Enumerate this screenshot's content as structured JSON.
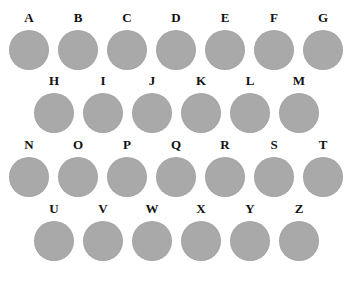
{
  "swatches": [
    {
      "label": "A"
    },
    {
      "label": "B"
    },
    {
      "label": "C"
    },
    {
      "label": "D"
    },
    {
      "label": "E"
    },
    {
      "label": "F"
    },
    {
      "label": "G"
    },
    {
      "label": "H"
    },
    {
      "label": "I"
    },
    {
      "label": "J"
    },
    {
      "label": "K"
    },
    {
      "label": "L"
    },
    {
      "label": "M"
    },
    {
      "label": "N"
    },
    {
      "label": "O"
    },
    {
      "label": "P"
    },
    {
      "label": "Q"
    },
    {
      "label": "R"
    },
    {
      "label": "S"
    },
    {
      "label": "T"
    },
    {
      "label": "U"
    },
    {
      "label": "V"
    },
    {
      "label": "W"
    },
    {
      "label": "X"
    },
    {
      "label": "Y"
    },
    {
      "label": "Z"
    }
  ],
  "colors": {
    "circle": "#a9a9a9",
    "label": "#111111",
    "background": "#ffffff"
  }
}
